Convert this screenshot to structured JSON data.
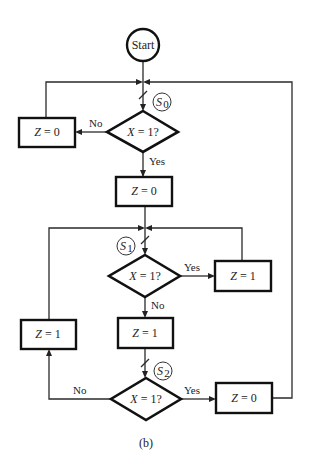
{
  "diagram": {
    "caption": "(b)",
    "start": {
      "label": "Start"
    },
    "states": [
      {
        "id": "S0",
        "letter": "S",
        "sub": "0"
      },
      {
        "id": "S1",
        "letter": "S",
        "sub": "1"
      },
      {
        "id": "S2",
        "letter": "S",
        "sub": "2"
      }
    ],
    "decisions": [
      {
        "id": "d0",
        "var": "X",
        "cond": " = 1?"
      },
      {
        "id": "d1",
        "var": "X",
        "cond": " = 1?"
      },
      {
        "id": "d2",
        "var": "X",
        "cond": " = 1?"
      }
    ],
    "boxes": [
      {
        "id": "b0_no",
        "var": "Z",
        "value": " = 0"
      },
      {
        "id": "b0_yes",
        "var": "Z",
        "value": " = 0"
      },
      {
        "id": "b1_yes",
        "var": "Z",
        "value": " = 1"
      },
      {
        "id": "b1_no",
        "var": "Z",
        "value": " = 1"
      },
      {
        "id": "b2_no",
        "var": "Z",
        "value": " = 1"
      },
      {
        "id": "b2_yes",
        "var": "Z",
        "value": " = 0"
      }
    ],
    "edge_labels": {
      "d0_no": "No",
      "d0_yes": "Yes",
      "d1_yes": "Yes",
      "d1_no": "No",
      "d2_no": "No",
      "d2_yes": "Yes"
    }
  }
}
